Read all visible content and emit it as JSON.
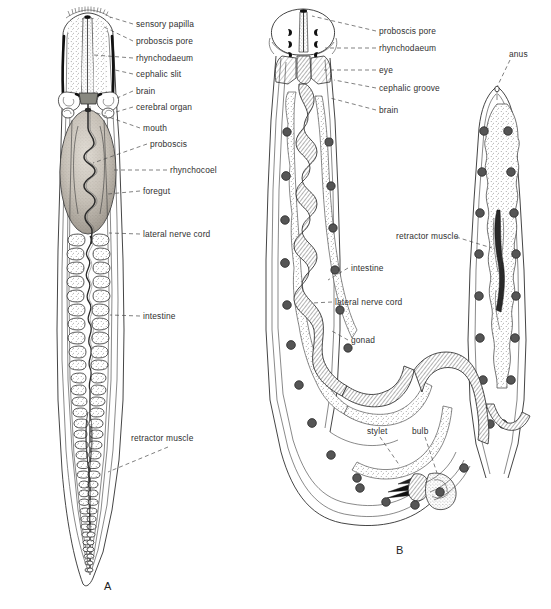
{
  "figure": {
    "background_color": "#ffffff",
    "ink_color": "#232323",
    "label_color": "#303030",
    "panels": [
      {
        "id": "A",
        "id_label": "A",
        "description": "dorsal view of anterior and posterior body of a nemertean worm",
        "labels": [
          "sensory papilla",
          "proboscis pore",
          "rhynchodaeum",
          "cephalic slit",
          "brain",
          "cerebral organ",
          "mouth",
          "proboscis",
          "rhynchocoel",
          "foregut",
          "lateral nerve cord",
          "intestine",
          "retractor muscle"
        ]
      },
      {
        "id": "B",
        "id_label": "B",
        "description": "U-shaped whole body view of a nemertean worm with everted structures",
        "labels": [
          "proboscis pore",
          "rhynchodaeum",
          "eye",
          "cephalic groove",
          "brain",
          "anus",
          "retractor muscle",
          "intestine",
          "lateral nerve cord",
          "gonad",
          "stylet",
          "bulb"
        ]
      }
    ],
    "label_items": [
      {
        "key": "a_sensory_papilla",
        "text": "sensory papilla"
      },
      {
        "key": "a_proboscis_pore",
        "text": "proboscis pore"
      },
      {
        "key": "a_rhynchodaeum",
        "text": "rhynchodaeum"
      },
      {
        "key": "a_cephalic_slit",
        "text": "cephalic slit"
      },
      {
        "key": "a_brain",
        "text": "brain"
      },
      {
        "key": "a_cerebral_organ",
        "text": "cerebral organ"
      },
      {
        "key": "a_mouth",
        "text": "mouth"
      },
      {
        "key": "a_proboscis",
        "text": "proboscis"
      },
      {
        "key": "a_rhynchocoel",
        "text": "rhynchocoel"
      },
      {
        "key": "a_foregut",
        "text": "foregut"
      },
      {
        "key": "a_lateral_nerve_cord",
        "text": "lateral nerve cord"
      },
      {
        "key": "a_intestine",
        "text": "intestine"
      },
      {
        "key": "a_retractor_muscle",
        "text": "retractor muscle"
      },
      {
        "key": "a_panel",
        "text": "A"
      },
      {
        "key": "b_proboscis_pore",
        "text": "proboscis pore"
      },
      {
        "key": "b_rhynchodaeum",
        "text": "rhynchodaeum"
      },
      {
        "key": "b_eye",
        "text": "eye"
      },
      {
        "key": "b_cephalic_groove",
        "text": "cephalic groove"
      },
      {
        "key": "b_brain",
        "text": "brain"
      },
      {
        "key": "b_anus",
        "text": "anus"
      },
      {
        "key": "b_retractor_muscle",
        "text": "retractor muscle"
      },
      {
        "key": "b_intestine",
        "text": "intestine"
      },
      {
        "key": "b_lateral_nerve_cord",
        "text": "lateral nerve cord"
      },
      {
        "key": "b_gonad",
        "text": "gonad"
      },
      {
        "key": "b_stylet",
        "text": "stylet"
      },
      {
        "key": "b_bulb",
        "text": "bulb"
      },
      {
        "key": "b_panel",
        "text": "B"
      }
    ]
  }
}
